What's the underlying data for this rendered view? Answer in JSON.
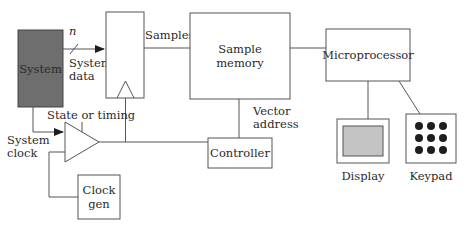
{
  "diagram": {
    "type": "block-diagram",
    "blocks": {
      "system": {
        "label": "System",
        "fill": "#6e6e6e"
      },
      "register": {
        "label": ""
      },
      "sample_memory": {
        "label_line1": "Sample",
        "label_line2": "memory"
      },
      "microprocessor": {
        "label": "Microprocessor"
      },
      "controller": {
        "label": "Controller"
      },
      "clock_gen": {
        "label_line1": "Clock",
        "label_line2": "gen"
      },
      "display": {
        "label": "Display",
        "screen_fill": "#c4c4c4"
      },
      "keypad": {
        "label": "Keypad",
        "keys": 9
      }
    },
    "signals": {
      "bus_width": "n",
      "system_data_line1": "System",
      "system_data_line2": "data",
      "samples": "Samples",
      "state_or_timing": "State or timing",
      "system_clock_line1": "System",
      "system_clock_line2": "clock",
      "vector_address_line1": "Vector",
      "vector_address_line2": "address"
    },
    "colors": {
      "stroke": "#555555",
      "text": "#2a2a2a",
      "system_fill": "#6e6e6e",
      "display_screen": "#c4c4c4",
      "keypad_key": "#1e1e1e"
    }
  }
}
